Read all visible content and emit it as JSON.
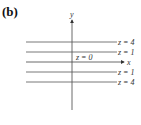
{
  "panel_label": "(b)",
  "axes": {
    "x_label": "x",
    "y_label": "y"
  },
  "level_curves": [
    {
      "label": "z = 4",
      "position": "top"
    },
    {
      "label": "z = 1",
      "position": "upper"
    },
    {
      "label": "z = 0",
      "position": "x-axis"
    },
    {
      "label": "z = 1",
      "position": "lower"
    },
    {
      "label": "z = 4",
      "position": "bottom"
    }
  ],
  "colors": {
    "line": "#444444",
    "text": "#333333"
  }
}
